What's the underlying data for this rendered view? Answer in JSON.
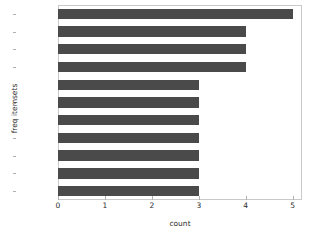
{
  "chart_data": {
    "type": "bar",
    "orientation": "horizontal",
    "title": "",
    "xlabel": "count",
    "ylabel": "freq itemsets",
    "categories": [
      "(A,)",
      "(D,)",
      "(F,)",
      "(F, A)",
      "(E,)",
      "(E, A)",
      "(E, F)",
      "(E, F, A)",
      "(B,)",
      "(C,)",
      "(D, A)"
    ],
    "values": [
      5,
      4,
      4,
      4,
      3,
      3,
      3,
      3,
      3,
      3,
      3
    ],
    "xlim": [
      0,
      5.2
    ],
    "xticks": [
      "0",
      "1",
      "2",
      "3",
      "4",
      "5"
    ],
    "xtick_values": [
      0,
      1,
      2,
      3,
      4,
      5
    ],
    "grid": false,
    "legend": "none",
    "bar_color": "#4a4a4a",
    "background_color": "#ffffff",
    "spine_color": "#c9c9c9"
  }
}
